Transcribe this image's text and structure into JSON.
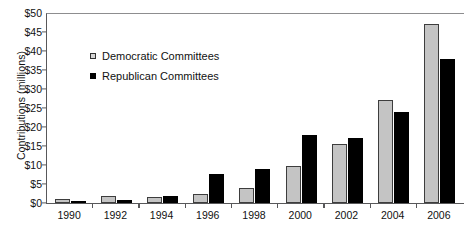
{
  "chart_data": {
    "type": "bar",
    "title": "",
    "subtitle": "",
    "xlabel": "",
    "ylabel": "Contributions (millions)",
    "ylim": [
      0,
      50
    ],
    "ytick_values": [
      0,
      5,
      10,
      15,
      20,
      25,
      30,
      35,
      40,
      45,
      50
    ],
    "ytick_labels": [
      "$0",
      "$5",
      "$10",
      "$15",
      "$20",
      "$25",
      "$30",
      "$35",
      "$40",
      "$45",
      "$50"
    ],
    "grid": false,
    "legend_position": "upper-left-inside",
    "categories": [
      "1990",
      "1992",
      "1994",
      "1996",
      "1998",
      "2000",
      "2002",
      "2004",
      "2006"
    ],
    "series": [
      {
        "name": "Democratic Committees",
        "color": "#c4c4c4",
        "edge_color": "#3d3d3d",
        "values": [
          1.0,
          1.9,
          1.6,
          2.5,
          4.0,
          9.7,
          15.5,
          27.0,
          47.0
        ]
      },
      {
        "name": "Republican Committees",
        "color": "#000000",
        "edge_color": "#000000",
        "values": [
          0.3,
          0.7,
          1.9,
          7.7,
          9.0,
          18.0,
          17.0,
          24.0,
          38.0
        ]
      }
    ],
    "annotations": []
  },
  "legend": {
    "items": [
      {
        "label": "Democratic Committees",
        "marker": "square-outline-gray"
      },
      {
        "label": "Republican Committees",
        "marker": "square-filled-black"
      }
    ]
  },
  "axes": {
    "y_title": "Contributions (millions)"
  }
}
